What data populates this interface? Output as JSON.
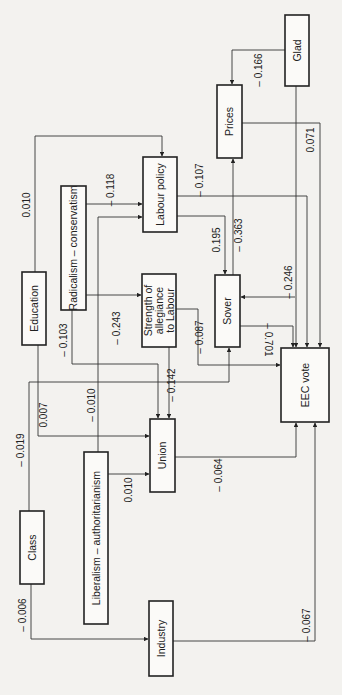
{
  "diagram": {
    "nodes": [
      {
        "id": "glad",
        "label": "Glad",
        "x": 285,
        "y": 15,
        "w": 24,
        "h": 71
      },
      {
        "id": "prices",
        "label": "Prices",
        "x": 217,
        "y": 85,
        "w": 25,
        "h": 73
      },
      {
        "id": "labour_policy",
        "label": "Labour policy",
        "x": 143,
        "y": 157,
        "w": 34,
        "h": 75
      },
      {
        "id": "radicalism",
        "label": "Radicalism – conservatism",
        "x": 61,
        "y": 186,
        "w": 25,
        "h": 124
      },
      {
        "id": "education",
        "label": "Education",
        "x": 22,
        "y": 272,
        "w": 24,
        "h": 73
      },
      {
        "id": "allegiance",
        "label_lines": [
          "Strength of",
          "allegiance",
          "to Labour"
        ],
        "x": 142,
        "y": 274,
        "w": 34,
        "h": 73
      },
      {
        "id": "sover",
        "label": "Sover",
        "x": 215,
        "y": 275,
        "w": 25,
        "h": 72
      },
      {
        "id": "eec_vote",
        "label": "EEC vote",
        "x": 281,
        "y": 348,
        "w": 48,
        "h": 74
      },
      {
        "id": "union",
        "label": "Union",
        "x": 150,
        "y": 419,
        "w": 25,
        "h": 73
      },
      {
        "id": "liberalism",
        "label": "Liberalism – authoritarianism",
        "x": 84,
        "y": 452,
        "w": 24,
        "h": 172
      },
      {
        "id": "class",
        "label": "Class",
        "x": 20,
        "y": 511,
        "w": 24,
        "h": 73
      },
      {
        "id": "industry",
        "label": "Industry",
        "x": 149,
        "y": 601,
        "w": 24,
        "h": 75
      }
    ],
    "edges": [
      {
        "from": "glad",
        "to": "prices",
        "coef": "– 0.166",
        "path": "M285,50 L232,50 L232,84",
        "label_x": 262,
        "label_y": 70
      },
      {
        "from": "glad",
        "to": "eec_vote",
        "coef": "",
        "path": "M296,86 L296,347",
        "label_x": 0,
        "label_y": 0
      },
      {
        "from": "prices",
        "to": "eec_vote",
        "coef": "0.071",
        "path": "M242,123 L320,123 L320,347",
        "label_x": 314,
        "label_y": 140
      },
      {
        "from": "education",
        "to": "labour_policy",
        "coef": "0.010",
        "path": "M35,272 L35,136 L162,136 L162,156",
        "label_x": 30,
        "label_y": 205
      },
      {
        "from": "radicalism",
        "to": "labour_policy",
        "coef": "– 0.118",
        "path": "M86,204 L142,204",
        "label_x": 114,
        "label_y": 190
      },
      {
        "from": "liberalism",
        "to": "labour_policy",
        "coef": "– 0.010",
        "path": "M98,452 L98,217 L142,217",
        "label_x": 95,
        "label_y": 405
      },
      {
        "from": "labour_policy",
        "to": "eec_vote",
        "coef": "– 0.107",
        "path": "M177,196 L307,196 L307,347",
        "label_x": 203,
        "label_y": 180
      },
      {
        "from": "labour_policy",
        "to": "sover",
        "coef": "0.195",
        "path": "M177,216 L225,216 L225,274",
        "label_x": 220,
        "label_y": 240
      },
      {
        "from": "sover",
        "to": "prices",
        "coef": "– 0.363",
        "path": "M233,275 L233,159",
        "label_x": 242,
        "label_y": 235
      },
      {
        "from": "glad",
        "to": "sover",
        "coef": "– 0.246",
        "path": "M295,297 L241,297",
        "label_x": 292,
        "label_y": 282
      },
      {
        "from": "radicalism",
        "to": "allegiance",
        "coef": "– 0.243",
        "path": "M86,295 L141,295",
        "label_x": 120,
        "label_y": 328
      },
      {
        "from": "radicalism",
        "to": "union",
        "coef": "– 0.103",
        "path": "M72,310 L72,364 L158,364 L158,418",
        "label_x": 67,
        "label_y": 340
      },
      {
        "from": "allegiance",
        "to": "eec_vote",
        "coef": "– 0.087",
        "path": "M176,309 L198,309 L198,365 L280,365",
        "label_x": 203,
        "label_y": 337
      },
      {
        "from": "allegiance",
        "to": "union",
        "coef": "– 0.142",
        "path": "M169,347 L169,418",
        "label_x": 175,
        "label_y": 385
      },
      {
        "from": "sover",
        "to": "eec_vote",
        "coef": "– 0.701",
        "path": "M240,326 L293,326 L293,347",
        "label_x": 265,
        "label_y": 340
      },
      {
        "from": "class",
        "to": "sover",
        "coef": "– 0.019",
        "path": "M29,511 L29,382 L229,382 L229,348",
        "label_x": 24,
        "label_y": 450
      },
      {
        "from": "education",
        "to": "union",
        "coef": "0.007",
        "path": "M38,345 L38,436 L149,436",
        "label_x": 47,
        "label_y": 415
      },
      {
        "from": "liberalism",
        "to": "union",
        "coef": "0.010",
        "path": "M108,474 L149,474",
        "label_x": 132,
        "label_y": 490
      },
      {
        "from": "union",
        "to": "eec_vote",
        "coef": "– 0.064",
        "path": "M175,457 L296,457 L296,423",
        "label_x": 222,
        "label_y": 475
      },
      {
        "from": "class",
        "to": "industry",
        "coef": "– 0.006",
        "path": "M31,584 L31,639 L148,639",
        "label_x": 26,
        "label_y": 615
      },
      {
        "from": "industry",
        "to": "eec_vote",
        "coef": "– 0.067",
        "path": "M173,641 L315,641 L315,423",
        "label_x": 310,
        "label_y": 625
      }
    ]
  }
}
